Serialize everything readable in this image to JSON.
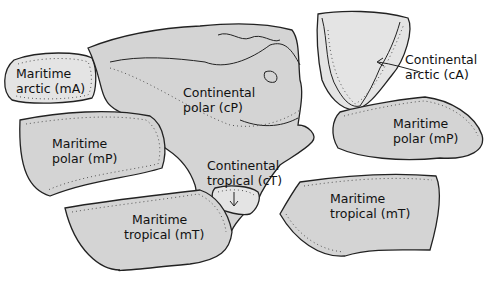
{
  "diagram": {
    "colors": {
      "region_fill": "#d4d4d4",
      "greenland_fill": "#e4e4e4",
      "outline": "#222222",
      "background": "#ffffff"
    },
    "regions": [
      {
        "id": "mA",
        "line1": "Maritime",
        "line2": "arctic  (mA)"
      },
      {
        "id": "cP",
        "line1": "Continental",
        "line2": "polar  (cP)"
      },
      {
        "id": "cA",
        "line1": "Continental",
        "line2": "arctic  (cA)"
      },
      {
        "id": "mP_pacific",
        "line1": "Maritime",
        "line2": "polar  (mP)"
      },
      {
        "id": "mP_atlantic",
        "line1": "Maritime",
        "line2": "polar  (mP)"
      },
      {
        "id": "cT",
        "line1": "Continental",
        "line2": "tropical (cT)"
      },
      {
        "id": "mT_pacific",
        "line1": "Maritime",
        "line2": "tropical  (mT)"
      },
      {
        "id": "mT_atlantic",
        "line1": "Maritime",
        "line2": "tropical  (mT)"
      }
    ]
  }
}
